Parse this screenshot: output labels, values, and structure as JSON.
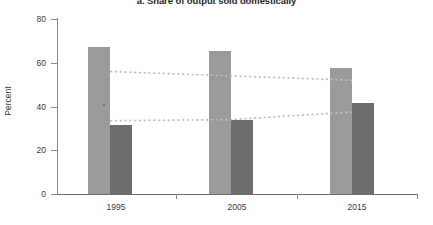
{
  "chart_data": {
    "type": "bar",
    "title": "a. Share of output sold domestically",
    "xlabel": "",
    "ylabel": "Percent",
    "categories": [
      "1995",
      "2005",
      "2015"
    ],
    "ylim": [
      0,
      80
    ],
    "yticks": [
      0,
      20,
      40,
      60,
      80
    ],
    "ytick_labels": [
      "0",
      "20",
      "40",
      "60",
      "80"
    ],
    "grid": false,
    "legend": "none",
    "series": [
      {
        "name": "light-gray-bar",
        "type": "bar",
        "color": "#9b9b9b",
        "values": [
          67,
          65.5,
          57.5
        ]
      },
      {
        "name": "dark-gray-bar",
        "type": "bar",
        "color": "#6d6d6d",
        "values": [
          31.5,
          34,
          41.5
        ]
      },
      {
        "name": "upper-dotted-trend-line",
        "type": "line",
        "style": "dotted",
        "color": "#bdbdbd",
        "values": [
          56,
          54,
          52
        ]
      },
      {
        "name": "lower-dotted-trend-line",
        "type": "line",
        "style": "dotted",
        "color": "#bdbdbd",
        "values": [
          33.5,
          34,
          37.5
        ]
      }
    ]
  },
  "colors": {
    "bar_light": "#9b9b9b",
    "bar_dark": "#6d6d6d",
    "trend_line": "#bdbdbd",
    "axis": "#8c8c8c",
    "text": "#3a3a3a",
    "title": "#2a2a2a",
    "background": "#ffffff"
  }
}
